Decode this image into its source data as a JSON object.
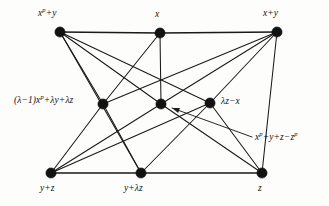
{
  "figure": {
    "type": "graph-diagram",
    "background_color": "#fdfdfc",
    "edge_color": "#191919",
    "vertex_color": "#121212"
  },
  "nodes": [
    {
      "id": "top-left",
      "label_html": "x<sup>p</sup>+y",
      "label_plain": "x^p+y",
      "x": 60,
      "y": 32,
      "row": "top"
    },
    {
      "id": "top-middle",
      "label_html": "x",
      "label_plain": "x",
      "x": 160,
      "y": 33,
      "row": "top"
    },
    {
      "id": "top-right",
      "label_html": "x+y",
      "label_plain": "x+y",
      "x": 277,
      "y": 32,
      "row": "top"
    },
    {
      "id": "middle-left",
      "label_html": "(&lambda;&minus;1)x<sup>p</sup>+&lambda;y+&lambda;z",
      "label_plain": "(λ−1)x^p+λy+λz",
      "x": 103,
      "y": 104,
      "row": "middle"
    },
    {
      "id": "middle-center",
      "label_html": "",
      "label_plain": "",
      "x": 161,
      "y": 104,
      "row": "middle"
    },
    {
      "id": "middle-right",
      "label_html": "&lambda;z&minus;x",
      "label_plain": "λz−x",
      "x": 210,
      "y": 103,
      "row": "middle"
    },
    {
      "id": "bottom-left",
      "label_html": "y+z",
      "label_plain": "y+z",
      "x": 51,
      "y": 173,
      "row": "bottom"
    },
    {
      "id": "bottom-middle",
      "label_html": "y+&lambda;z",
      "label_plain": "y+λz",
      "x": 141,
      "y": 173,
      "row": "bottom"
    },
    {
      "id": "bottom-right",
      "label_html": "z",
      "label_plain": "z",
      "x": 262,
      "y": 173,
      "row": "bottom"
    }
  ],
  "labels": {
    "top_left": "x<sup>p</sup>+y",
    "top_middle": "x",
    "top_right": "x+y",
    "middle_left": "(&lambda;&minus;1)x<sup>p</sup>+&lambda;y+&lambda;z",
    "middle_right": "&lambda;z&minus;x",
    "bottom_left": "y+z",
    "bottom_middle": "y+&lambda;z",
    "bottom_right": "z",
    "callout": "x<sup>p</sup>+y+z&minus;z<sup>p</sup>"
  },
  "callout": {
    "text": "x<sup>p</sup>+y+z&minus;z<sup>p</sup>",
    "text_plain": "x^p+y+z−z^p",
    "points_to": "middle-center",
    "arrow_tail_x": 252,
    "arrow_tail_y": 137,
    "arrow_head_x": 172,
    "arrow_head_y": 108
  },
  "edges": [
    {
      "from": "top-left",
      "to": "top-middle",
      "kind": "rail"
    },
    {
      "from": "top-middle",
      "to": "top-right",
      "kind": "rail"
    },
    {
      "from": "bottom-left",
      "to": "bottom-middle",
      "kind": "rail"
    },
    {
      "from": "bottom-middle",
      "to": "bottom-right",
      "kind": "rail"
    },
    {
      "from": "top-left",
      "to": "middle-left",
      "kind": "edge"
    },
    {
      "from": "top-left",
      "to": "middle-center",
      "kind": "edge"
    },
    {
      "from": "top-left",
      "to": "middle-right",
      "kind": "edge"
    },
    {
      "from": "top-middle",
      "to": "middle-left",
      "kind": "edge"
    },
    {
      "from": "top-middle",
      "to": "middle-center",
      "kind": "edge"
    },
    {
      "from": "top-right",
      "to": "middle-left",
      "kind": "edge"
    },
    {
      "from": "top-right",
      "to": "middle-center",
      "kind": "edge"
    },
    {
      "from": "top-right",
      "to": "middle-right",
      "kind": "edge"
    },
    {
      "from": "middle-left",
      "to": "bottom-left",
      "kind": "edge"
    },
    {
      "from": "middle-left",
      "to": "bottom-middle",
      "kind": "edge"
    },
    {
      "from": "middle-center",
      "to": "bottom-left",
      "kind": "edge"
    },
    {
      "from": "middle-center",
      "to": "bottom-right",
      "kind": "edge"
    },
    {
      "from": "middle-right",
      "to": "bottom-left",
      "kind": "edge"
    },
    {
      "from": "middle-right",
      "to": "bottom-middle",
      "kind": "edge"
    },
    {
      "from": "middle-right",
      "to": "bottom-right",
      "kind": "edge"
    },
    {
      "from": "top-left",
      "to": "bottom-middle",
      "kind": "edge"
    },
    {
      "from": "top-right",
      "to": "bottom-right",
      "kind": "edge"
    }
  ]
}
